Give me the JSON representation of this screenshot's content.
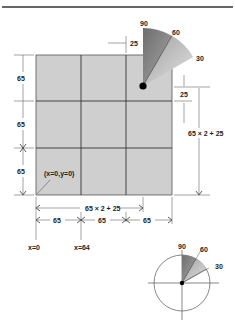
{
  "diagram": {
    "type": "tile-grid-with-angle-sectors",
    "colors": {
      "grid_fill": "#cfcfcf",
      "grid_line": "#444444",
      "sector_dark": "#7a7a7a",
      "sector_light": "#c8c8c8",
      "dim_line": "#555555",
      "rule": "#333333"
    },
    "grid": {
      "rows": 3,
      "cols": 3,
      "origin_label": "(x=0,y=0)"
    },
    "top_sector": {
      "angle_labels": [
        "90",
        "60",
        "30"
      ]
    },
    "bottom_circle": {
      "angle_labels": [
        "90",
        "60",
        "30"
      ]
    },
    "dimensions": {
      "left": [
        "65",
        "65",
        "65"
      ],
      "top_offset": "25",
      "right_offset": "25",
      "right_total": "65 × 2 + 25",
      "bottom_total": "65 × 2 + 25",
      "bottom_segments": [
        "65",
        "65",
        "65"
      ]
    },
    "x_markers": [
      "x=0",
      "x=64"
    ]
  }
}
